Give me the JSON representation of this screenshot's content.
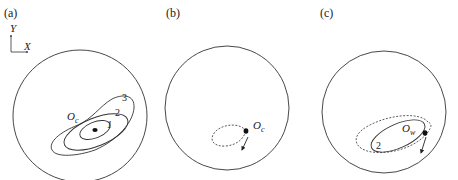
{
  "panels": [
    {
      "id": "a",
      "label": "(a)",
      "axis": {
        "y_label": "Y",
        "x_label": "X"
      },
      "center_label": {
        "main": "O",
        "sub": "c"
      },
      "contour_labels": [
        "1",
        "2",
        "3"
      ]
    },
    {
      "id": "b",
      "label": "(b)",
      "center_label": {
        "main": "O",
        "sub": "c"
      },
      "path_style": "dashed loop with direction arrow"
    },
    {
      "id": "c",
      "label": "(c)",
      "center_label": {
        "main": "O",
        "sub": "w"
      },
      "contour_labels": [
        "2"
      ],
      "path_style": "solid contour 2 with dashed outer loop and direction arrow"
    }
  ],
  "colors": {
    "stroke": "#333333",
    "background": "#ffffff"
  }
}
